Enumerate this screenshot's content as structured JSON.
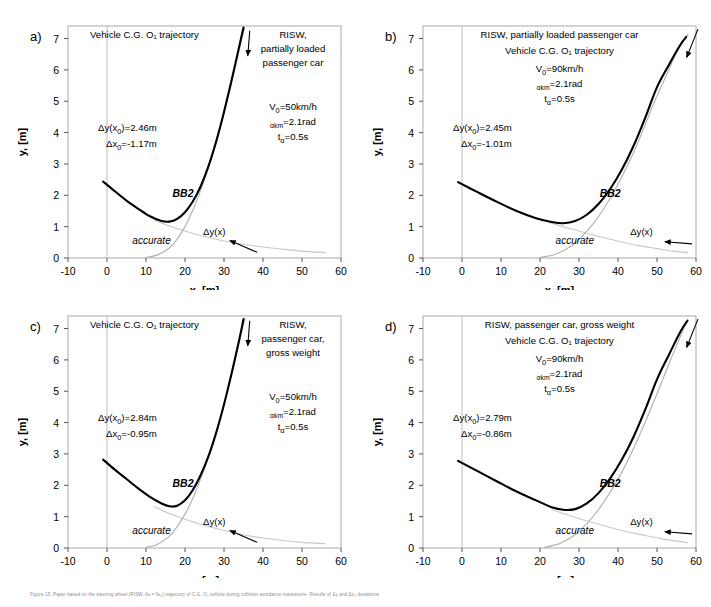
{
  "figure": {
    "caption": "Figure 15.   Paper based on the steering wheel (RISW, δₕ = δₕ₀) trajectory of C.G. O₁ vehicle during collision avoidance manoeuvre. Results of Δy and Δx₀ deviations",
    "axis_x_title": "x, [m]",
    "axis_y_title": "y, [m]",
    "x_ticks": [
      "-10",
      "0",
      "10",
      "20",
      "30",
      "40",
      "50",
      "60"
    ],
    "y_ticks": [
      "0",
      "1",
      "2",
      "3",
      "4",
      "5",
      "6",
      "7"
    ],
    "xlim": [
      -10,
      60
    ],
    "ylim": [
      0,
      7.4
    ],
    "curve_label_bb2": "BB2",
    "curve_label_accurate": "accurate",
    "curve_label_dy": "Δy(x)",
    "colors": {
      "bb2": "#000000",
      "accurate": "#b4b4b4",
      "dy": "#c8c8c8",
      "frame": "#a9a9a9",
      "background": "#ffffff"
    }
  },
  "panels": [
    {
      "id": "a",
      "label": "a)",
      "title_lines": [
        "Vehicle C.G. O₁ trajectory"
      ],
      "header_lines": [
        "RISW,",
        "partially loaded",
        "passenger car"
      ],
      "params": {
        "v0_main": "V",
        "v0_sub": "0",
        "v0_val": "=50km/h",
        "alpha_sub": "αkm",
        "alpha_val": "=2.1rad",
        "t_main": "t",
        "t_sub": "α",
        "t_val": "=0.5s"
      },
      "deviations": {
        "dy_label": "Δy(x",
        "dy_sub": "0",
        "dy_val": ")=2.46m",
        "dx_label": "Δx",
        "dx_sub": "0",
        "dx_val": "=-1.17m"
      },
      "chart_data": {
        "type": "line",
        "title": "Vehicle C.G. O1 trajectory",
        "xlabel": "x, [m]",
        "ylabel": "y, [m]",
        "xlim": [
          -10,
          60
        ],
        "ylim": [
          0,
          7.4
        ],
        "grid": false,
        "series": [
          {
            "name": "BB2",
            "points": [
              [
                -1,
                2.44
              ],
              [
                2,
                2.13
              ],
              [
                5,
                1.83
              ],
              [
                8,
                1.57
              ],
              [
                11,
                1.33
              ],
              [
                14,
                1.18
              ],
              [
                16,
                1.16
              ],
              [
                18,
                1.25
              ],
              [
                20,
                1.46
              ],
              [
                22,
                1.8
              ],
              [
                24,
                2.28
              ],
              [
                26,
                2.92
              ],
              [
                28,
                3.72
              ],
              [
                30,
                4.66
              ],
              [
                32,
                5.7
              ],
              [
                34,
                6.8
              ],
              [
                35,
                7.35
              ]
            ]
          },
          {
            "name": "accurate",
            "points": [
              [
                10,
                0.02
              ],
              [
                13,
                0.1
              ],
              [
                16,
                0.32
              ],
              [
                18,
                0.6
              ],
              [
                20,
                1.0
              ],
              [
                22,
                1.52
              ],
              [
                24,
                2.15
              ],
              [
                26,
                2.9
              ],
              [
                28,
                3.72
              ],
              [
                30,
                4.62
              ],
              [
                32,
                5.62
              ],
              [
                34,
                6.7
              ],
              [
                35.3,
                7.35
              ]
            ]
          },
          {
            "name": "dy(x)",
            "points": [
              [
                12,
                1.22
              ],
              [
                16,
                1.02
              ],
              [
                20,
                0.86
              ],
              [
                24,
                0.72
              ],
              [
                28,
                0.6
              ],
              [
                32,
                0.5
              ],
              [
                36,
                0.42
              ],
              [
                40,
                0.35
              ],
              [
                45,
                0.28
              ],
              [
                50,
                0.22
              ],
              [
                56,
                0.17
              ]
            ]
          }
        ]
      }
    },
    {
      "id": "b",
      "label": "b)",
      "title_lines": [
        "RISW, partially loaded passenger car",
        "Vehicle C.G. O₁ trajectory"
      ],
      "header_lines": [],
      "params": {
        "v0_main": "V",
        "v0_sub": "0",
        "v0_val": "=90km/h",
        "alpha_sub": "αkm",
        "alpha_val": "=2.1rad",
        "t_main": "t",
        "t_sub": "α",
        "t_val": "=0.5s"
      },
      "deviations": {
        "dy_label": "Δy(x",
        "dy_sub": "0",
        "dy_val": ")=2.45m",
        "dx_label": "Δx",
        "dx_sub": "0",
        "dx_val": "=-1.01m"
      },
      "chart_data": {
        "type": "line",
        "title": "RISW, partially loaded passenger car",
        "xlabel": "x, [m]",
        "ylabel": "y, [m]",
        "xlim": [
          -10,
          60
        ],
        "ylim": [
          0,
          7.4
        ],
        "grid": false,
        "series": [
          {
            "name": "BB2",
            "points": [
              [
                -1,
                2.42
              ],
              [
                4,
                2.1
              ],
              [
                9,
                1.79
              ],
              [
                14,
                1.5
              ],
              [
                19,
                1.27
              ],
              [
                23,
                1.15
              ],
              [
                26,
                1.11
              ],
              [
                29,
                1.18
              ],
              [
                32,
                1.38
              ],
              [
                35,
                1.72
              ],
              [
                38,
                2.2
              ],
              [
                41,
                2.82
              ],
              [
                44,
                3.58
              ],
              [
                47,
                4.48
              ],
              [
                50,
                5.45
              ],
              [
                53,
                6.15
              ],
              [
                56,
                6.8
              ],
              [
                57.5,
                7.05
              ]
            ]
          },
          {
            "name": "accurate",
            "points": [
              [
                20,
                0.02
              ],
              [
                24,
                0.12
              ],
              [
                28,
                0.38
              ],
              [
                31,
                0.72
              ],
              [
                34,
                1.15
              ],
              [
                37,
                1.7
              ],
              [
                40,
                2.35
              ],
              [
                43,
                3.1
              ],
              [
                46,
                3.95
              ],
              [
                49,
                4.88
              ],
              [
                52,
                5.72
              ],
              [
                55,
                6.55
              ],
              [
                58,
                7.15
              ]
            ]
          },
          {
            "name": "dy(x)",
            "points": [
              [
                22,
                1.14
              ],
              [
                26,
                1.0
              ],
              [
                30,
                0.86
              ],
              [
                34,
                0.72
              ],
              [
                38,
                0.6
              ],
              [
                42,
                0.48
              ],
              [
                46,
                0.38
              ],
              [
                50,
                0.3
              ],
              [
                54,
                0.22
              ],
              [
                58,
                0.17
              ]
            ]
          }
        ]
      }
    },
    {
      "id": "c",
      "label": "c)",
      "title_lines": [
        "Vehicle C.G. O₁ trajectory"
      ],
      "header_lines": [
        "RISW,",
        "passenger car,",
        "gross weight"
      ],
      "params": {
        "v0_main": "V",
        "v0_sub": "0",
        "v0_val": "=50km/h",
        "alpha_sub": "αkm",
        "alpha_val": "=2.1rad",
        "t_main": "t",
        "t_sub": "α",
        "t_val": "=0.5s"
      },
      "deviations": {
        "dy_label": "Δy(x",
        "dy_sub": "0",
        "dy_val": ")=2.84m",
        "dx_label": "Δx",
        "dx_sub": "0",
        "dx_val": "=-0.95m"
      },
      "chart_data": {
        "type": "line",
        "title": "Vehicle C.G. O1 trajectory",
        "xlabel": "x, [m]",
        "ylabel": "y, [m]",
        "xlim": [
          -10,
          60
        ],
        "ylim": [
          0,
          7.4
        ],
        "grid": false,
        "series": [
          {
            "name": "BB2",
            "points": [
              [
                -1,
                2.82
              ],
              [
                2,
                2.5
              ],
              [
                5,
                2.2
              ],
              [
                8,
                1.9
              ],
              [
                11,
                1.63
              ],
              [
                14,
                1.42
              ],
              [
                16,
                1.33
              ],
              [
                18,
                1.35
              ],
              [
                20,
                1.52
              ],
              [
                22,
                1.85
              ],
              [
                24,
                2.32
              ],
              [
                26,
                2.92
              ],
              [
                28,
                3.68
              ],
              [
                30,
                4.58
              ],
              [
                32,
                5.6
              ],
              [
                34,
                6.7
              ],
              [
                35,
                7.3
              ]
            ]
          },
          {
            "name": "accurate",
            "points": [
              [
                10,
                0.02
              ],
              [
                13,
                0.12
              ],
              [
                16,
                0.38
              ],
              [
                18,
                0.68
              ],
              [
                20,
                1.08
              ],
              [
                22,
                1.58
              ],
              [
                24,
                2.2
              ],
              [
                26,
                2.9
              ],
              [
                28,
                3.7
              ],
              [
                30,
                4.58
              ],
              [
                32,
                5.55
              ],
              [
                34,
                6.62
              ],
              [
                35.4,
                7.32
              ]
            ]
          },
          {
            "name": "dy(x)",
            "points": [
              [
                12,
                1.32
              ],
              [
                16,
                1.1
              ],
              [
                20,
                0.92
              ],
              [
                24,
                0.76
              ],
              [
                28,
                0.62
              ],
              [
                32,
                0.5
              ],
              [
                36,
                0.4
              ],
              [
                40,
                0.32
              ],
              [
                45,
                0.24
              ],
              [
                50,
                0.18
              ],
              [
                56,
                0.14
              ]
            ]
          }
        ]
      }
    },
    {
      "id": "d",
      "label": "d)",
      "title_lines": [
        "RISW,  passenger car,  gross weight",
        "Vehicle C.G. O₁ trajectory"
      ],
      "header_lines": [],
      "params": {
        "v0_main": "V",
        "v0_sub": "0",
        "v0_val": "=90km/h",
        "alpha_sub": "αkm",
        "alpha_val": "=2.1rad",
        "t_main": "t",
        "t_sub": "α",
        "t_val": "=0.5s"
      },
      "deviations": {
        "dy_label": "Δy(x",
        "dy_sub": "0",
        "dy_val": ")=2.79m",
        "dx_label": "Δx",
        "dx_sub": "0",
        "dx_val": "=-0.86m"
      },
      "chart_data": {
        "type": "line",
        "title": "RISW, passenger car, gross weight",
        "xlabel": "x, [m]",
        "ylabel": "y, [m]",
        "xlim": [
          -10,
          60
        ],
        "ylim": [
          0,
          7.4
        ],
        "grid": false,
        "series": [
          {
            "name": "BB2",
            "points": [
              [
                -1,
                2.78
              ],
              [
                4,
                2.45
              ],
              [
                9,
                2.12
              ],
              [
                14,
                1.8
              ],
              [
                19,
                1.52
              ],
              [
                23,
                1.3
              ],
              [
                26,
                1.22
              ],
              [
                29,
                1.24
              ],
              [
                32,
                1.42
              ],
              [
                35,
                1.75
              ],
              [
                38,
                2.22
              ],
              [
                41,
                2.82
              ],
              [
                44,
                3.55
              ],
              [
                47,
                4.42
              ],
              [
                50,
                5.38
              ],
              [
                53,
                6.15
              ],
              [
                56,
                6.9
              ],
              [
                57.8,
                7.25
              ]
            ]
          },
          {
            "name": "accurate",
            "points": [
              [
                21,
                0.02
              ],
              [
                25,
                0.14
              ],
              [
                29,
                0.42
              ],
              [
                32,
                0.78
              ],
              [
                35,
                1.22
              ],
              [
                38,
                1.78
              ],
              [
                41,
                2.42
              ],
              [
                44,
                3.18
              ],
              [
                47,
                4.02
              ],
              [
                50,
                4.92
              ],
              [
                53,
                5.85
              ],
              [
                56,
                6.75
              ],
              [
                58,
                7.3
              ]
            ]
          },
          {
            "name": "dy(x)",
            "points": [
              [
                23,
                1.22
              ],
              [
                27,
                1.06
              ],
              [
                31,
                0.9
              ],
              [
                35,
                0.76
              ],
              [
                39,
                0.62
              ],
              [
                43,
                0.5
              ],
              [
                47,
                0.4
              ],
              [
                51,
                0.3
              ],
              [
                55,
                0.22
              ],
              [
                58,
                0.17
              ]
            ]
          }
        ]
      }
    }
  ]
}
